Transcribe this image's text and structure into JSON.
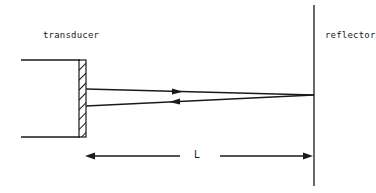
{
  "diagram": {
    "type": "ultrasonic pulse-echo schematic",
    "labels": {
      "transducer": "transducer",
      "reflector": "reflector",
      "distance": "L"
    },
    "elements": [
      {
        "id": "transducer",
        "shape": "rectangle with hatched front face"
      },
      {
        "id": "reflector",
        "shape": "vertical line"
      },
      {
        "id": "incident-beam",
        "direction": "transducer to reflector"
      },
      {
        "id": "reflected-beam",
        "direction": "reflector to transducer"
      },
      {
        "id": "distance-arrow",
        "label": "L",
        "span": "transducer face to reflector"
      }
    ],
    "colors": {
      "ink": "#1a1a1a",
      "background": "#ffffff"
    }
  }
}
